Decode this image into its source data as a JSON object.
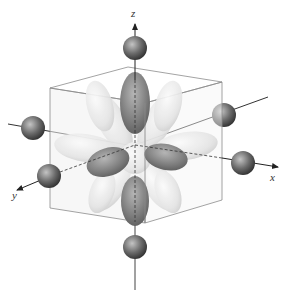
{
  "figure": {
    "axes": {
      "x_label": "x",
      "y_label": "y",
      "z_label": "z"
    },
    "ligand_count": 6,
    "colors": {
      "background": "#ffffff",
      "ligand_dark": "#3a3a3a",
      "ligand_light": "#b8b8b8",
      "lobe_light": "#e6e6e6",
      "lobe_dark": "#707070",
      "cube_edge": "#8a8a8a",
      "cube_face": "#eeeeee",
      "axis_line": "#333333"
    }
  }
}
